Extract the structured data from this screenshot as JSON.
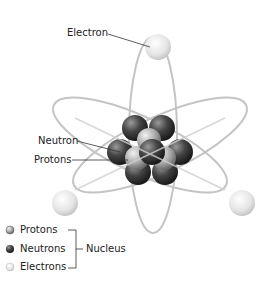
{
  "diagram": {
    "labels": {
      "electron": "Electron",
      "neutron": "Neutron",
      "protons": "Protons"
    },
    "legend": {
      "items": [
        {
          "label": "Protons",
          "icon": "proton-icon"
        },
        {
          "label": "Neutrons",
          "icon": "neutron-icon"
        },
        {
          "label": "Electrons",
          "icon": "electron-icon"
        }
      ],
      "group_label": "Nucleus"
    },
    "colors": {
      "orbit": "#c8c8c8",
      "neutron": "#3a3a3a",
      "proton": "#a8a8a8",
      "electron": "#e6e6e6"
    }
  }
}
